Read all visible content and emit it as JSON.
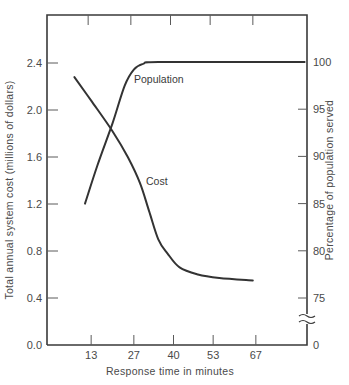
{
  "chart_data": {
    "type": "line",
    "title": "",
    "xlabel": "Response time in minutes",
    "ylabel": "Total annual system cost (millions of dollars)",
    "y2label": "Percentage of population served",
    "x_ticks": [
      13,
      27,
      40,
      53,
      67
    ],
    "y_ticks": [
      "0.0",
      "0.4",
      "0.8",
      "1.2",
      "1.6",
      "2.0",
      "2.4"
    ],
    "y2_ticks": [
      "0",
      "75",
      "80",
      "85",
      "90",
      "95",
      "100"
    ],
    "ylim": [
      0,
      2.4
    ],
    "y2lim": [
      75,
      100
    ],
    "y2_axis_break": true,
    "grid": false,
    "legend": "inline curve labels",
    "series": [
      {
        "name": "Cost",
        "axis": "left",
        "x": [
          7.5,
          13,
          20,
          25,
          29,
          32,
          35,
          38,
          42,
          48,
          55,
          66
        ],
        "values": [
          2.28,
          2.08,
          1.82,
          1.6,
          1.38,
          1.14,
          0.9,
          0.78,
          0.66,
          0.6,
          0.57,
          0.55
        ]
      },
      {
        "name": "Population",
        "axis": "right",
        "x": [
          11,
          15,
          20,
          24,
          27,
          30,
          35,
          67,
          83
        ],
        "values": [
          85,
          89,
          93.5,
          97.5,
          99.2,
          99.8,
          100,
          100,
          100
        ]
      }
    ],
    "annotations": [
      {
        "text": "Population",
        "series": "Population"
      },
      {
        "text": "Cost",
        "series": "Cost"
      }
    ]
  }
}
